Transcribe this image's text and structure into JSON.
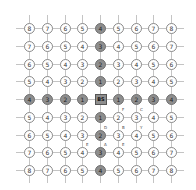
{
  "diagram": {
    "type": "grid-network",
    "rows": 9,
    "cols": 9,
    "center_label": "BS",
    "values": [
      [
        "8",
        "7",
        "6",
        "5",
        "4",
        "5",
        "6",
        "7",
        "8"
      ],
      [
        "7",
        "6",
        "5",
        "4",
        "3",
        "4",
        "5",
        "6",
        "7"
      ],
      [
        "6",
        "5",
        "4",
        "3",
        "2",
        "3",
        "4",
        "5",
        "6"
      ],
      [
        "5",
        "4",
        "3",
        "2",
        "1",
        "2",
        "3",
        "4",
        "5"
      ],
      [
        "4",
        "3",
        "2",
        "1",
        "BS",
        "1",
        "2",
        "3",
        "4"
      ],
      [
        "5",
        "4",
        "3",
        "2",
        "1",
        "2",
        "3",
        "4",
        "5"
      ],
      [
        "6",
        "5",
        "4",
        "3",
        "2",
        "3",
        "4",
        "5",
        "6"
      ],
      [
        "7",
        "6",
        "5",
        "4",
        "3",
        "4",
        "5",
        "6",
        "7"
      ],
      [
        "8",
        "7",
        "6",
        "5",
        "4",
        "5",
        "6",
        "7",
        "8"
      ]
    ],
    "highlighted_row": 4,
    "highlighted_col": 4,
    "tags": [
      {
        "row": 5,
        "col": 5,
        "label": "F"
      },
      {
        "row": 5,
        "col": 6,
        "label": "C"
      },
      {
        "row": 6,
        "col": 4,
        "label": "D"
      },
      {
        "row": 6,
        "col": 5,
        "label": "B"
      },
      {
        "row": 6,
        "col": 6,
        "label": "Y"
      },
      {
        "row": 7,
        "col": 3,
        "label": "E"
      },
      {
        "row": 7,
        "col": 4,
        "label": "A"
      },
      {
        "row": 7,
        "col": 5,
        "label": "E"
      }
    ],
    "colors": {
      "line": "#c4c4c4",
      "node_fill": "#ffffff",
      "highlight_fill": "#8e8e8e"
    }
  }
}
